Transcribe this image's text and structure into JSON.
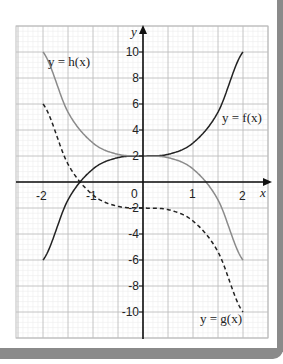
{
  "chart_data": {
    "type": "line",
    "title": "",
    "xlabel": "x",
    "ylabel": "y",
    "xlim": [
      -2.5,
      2.5
    ],
    "ylim": [
      -12,
      12
    ],
    "grid": true,
    "x_ticks": [
      "-2",
      "-1",
      "0",
      "1",
      "2"
    ],
    "y_ticks": [
      "10",
      "8",
      "6",
      "4",
      "2",
      "-2",
      "-4",
      "-6",
      "-8",
      "-10"
    ],
    "series": [
      {
        "name": "y = f(x)",
        "style": "solid",
        "color": "#222222",
        "x": [
          -2,
          -1.5,
          -1,
          -0.5,
          0,
          0.5,
          1,
          1.5,
          2
        ],
        "y": [
          -6,
          -1.375,
          1,
          1.875,
          2,
          2.125,
          3,
          5.375,
          10
        ]
      },
      {
        "name": "y = h(x)",
        "style": "solid",
        "color": "#8a8a8a",
        "x": [
          -2,
          -1.5,
          -1,
          -0.5,
          0,
          0.5,
          1,
          1.5,
          2
        ],
        "y": [
          10,
          5.375,
          3,
          2.125,
          2,
          1.875,
          1,
          -1.375,
          -6
        ]
      },
      {
        "name": "y = g(x)",
        "style": "dashed",
        "color": "#222222",
        "x": [
          -2,
          -1.5,
          -1,
          -0.5,
          0,
          0.5,
          1,
          1.5,
          2
        ],
        "y": [
          6,
          1.375,
          -1,
          -1.875,
          -2,
          -2.125,
          -3,
          -5.375,
          -10
        ]
      }
    ],
    "annotations": [
      "y = h(x)",
      "y = f(x)",
      "y = g(x)"
    ]
  },
  "labels": {
    "x_axis": "x",
    "y_axis": "y",
    "f": "y = f(x)",
    "h": "y = h(x)",
    "g": "y = g(x)",
    "x_ticks": {
      "m2": "-2",
      "m1": "-1",
      "zero": "0",
      "p1": "1",
      "p2": "2"
    },
    "y_ticks": {
      "p10": "10",
      "p8": "8",
      "p6": "6",
      "p4": "4",
      "p2": "2",
      "m2": "-2",
      "m4": "-4",
      "m6": "-6",
      "m8": "-8",
      "m10": "-10"
    }
  },
  "colors": {
    "frame": "#8a8a8a",
    "grid_minor": "#ececec",
    "grid_major": "#bdbdbd",
    "f": "#222222",
    "h": "#8a8a8a",
    "g": "#222222"
  }
}
